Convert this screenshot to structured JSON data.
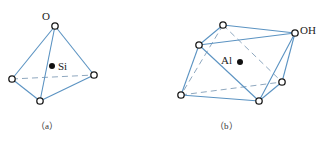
{
  "figure": {
    "panels": [
      {
        "id": "a",
        "caption": "（a）",
        "shape": "tetrahedron",
        "center_atom": "Si",
        "vertex_label": "O",
        "vertices": {
          "top": [
            55,
            26
          ],
          "left": [
            12,
            79
          ],
          "right": [
            94,
            75
          ],
          "bottom": [
            40,
            101
          ]
        },
        "center": [
          52,
          66
        ]
      },
      {
        "id": "b",
        "caption": "（b）",
        "shape": "octahedron",
        "center_atom": "Al",
        "vertex_label": "OH",
        "vertices": {
          "top": [
            223,
            25
          ],
          "right_top": [
            295,
            33
          ],
          "left_top": [
            199,
            45
          ],
          "right_bottom": [
            282,
            82
          ],
          "left_bottom": [
            181,
            95
          ],
          "bottom": [
            259,
            101
          ]
        },
        "center": [
          240,
          62
        ]
      }
    ],
    "colors": {
      "edge": "#5b93c2",
      "dashed_edge": "#8fa8bf",
      "atom_outline": "#1a1a1a",
      "center_atom": "#111111"
    }
  }
}
